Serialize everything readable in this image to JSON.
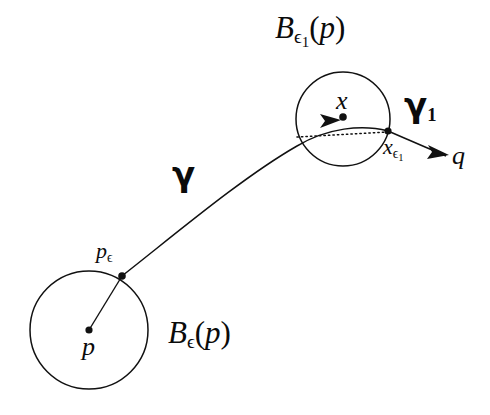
{
  "figure": {
    "background_color": "#ffffff",
    "stroke_color": "#111111",
    "labels": {
      "ball_eps1_of_p": {
        "base": "B",
        "subscript": "ϵ₁",
        "argument": "(p)",
        "text": "Bϵ₁(p)"
      },
      "ball_eps_of_p": {
        "base": "B",
        "subscript": "ϵ",
        "argument": "(p)",
        "text": "Bϵ(p)"
      },
      "point_x": {
        "text": "x"
      },
      "point_x_eps1": {
        "base": "x",
        "subscript": "ϵ₁",
        "text": "xϵ₁"
      },
      "point_q": {
        "text": "q"
      },
      "point_p": {
        "text": "p"
      },
      "point_p_eps": {
        "base": "p",
        "subscript": "ϵ",
        "text": "pϵ"
      },
      "curve_gamma": {
        "text": "γ"
      },
      "curve_gamma1": {
        "base": "γ",
        "subscript": "1",
        "text": "γ₁"
      }
    },
    "geometry": {
      "small_ball": {
        "name": "B_eps1(p)",
        "center": [
          343,
          119
        ],
        "radius": 47,
        "center_point_label": "x"
      },
      "large_ball": {
        "name": "B_eps(p)",
        "center": [
          89,
          330
        ],
        "radius": 59,
        "center_point_label": "p"
      },
      "boundary_point_p_eps": [
        122,
        276
      ],
      "boundary_point_x_eps1": [
        388,
        131
      ],
      "radius_segment": {
        "from": [
          89,
          330
        ],
        "to": [
          122,
          276
        ]
      },
      "geodesic_gamma": {
        "from": [
          122,
          276
        ],
        "to": [
          388,
          131
        ],
        "style": "solid curve",
        "arrowhead_at": [
          331,
          118
        ]
      },
      "chord_dotted": {
        "from": [
          297,
          135
        ],
        "to": [
          388,
          131
        ],
        "style": "dotted"
      },
      "segment_to_q": {
        "from": [
          388,
          131
        ],
        "to": [
          448,
          157
        ],
        "style": "solid",
        "arrowhead_at": [
          440,
          153
        ]
      }
    }
  }
}
